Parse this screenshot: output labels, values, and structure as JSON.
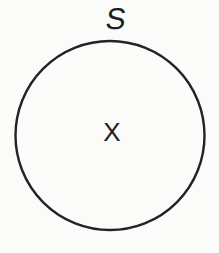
{
  "figure": {
    "set_label": "S",
    "element_label": "X",
    "colors": {
      "stroke": "#232323",
      "background": "#fbfbf9",
      "text": "#1e1e1e"
    }
  }
}
